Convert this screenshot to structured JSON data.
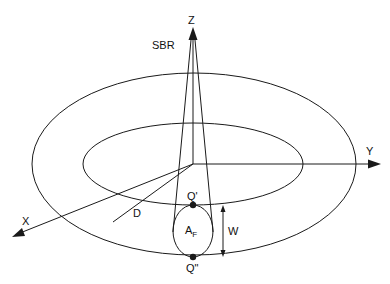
{
  "diagram": {
    "labels": {
      "z_axis": "Z",
      "y_axis": "Y",
      "x_axis": "X",
      "source": "SBR",
      "distance": "D",
      "width": "W",
      "point_top": "Q'",
      "point_bottom": "Q\"",
      "area_main": "A",
      "area_sub": "F"
    },
    "colors": {
      "stroke": "#1a1a1a",
      "background": "#ffffff"
    }
  }
}
